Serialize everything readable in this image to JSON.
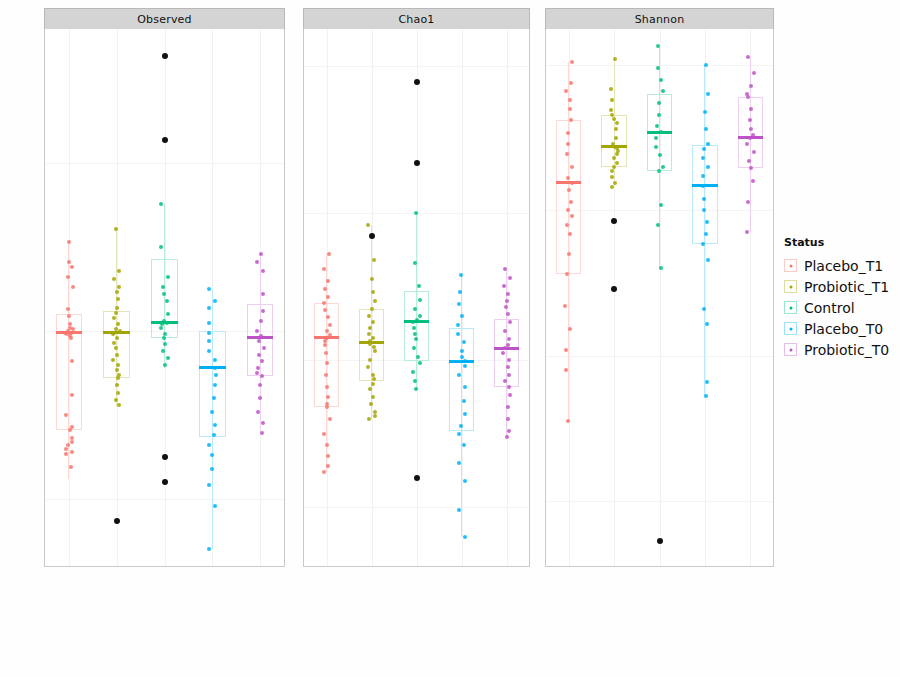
{
  "figure": {
    "ylabel": "Alpha Diversity Measure",
    "legend_title": "Status",
    "panel_order": [
      "Observed",
      "Chao1",
      "Shannon"
    ]
  },
  "legend": {
    "title": "Status",
    "items": [
      {
        "label": "Placebo_T1",
        "color": "#F8766D"
      },
      {
        "label": "Probiotic_T1",
        "color": "#A3A500"
      },
      {
        "label": "Control",
        "color": "#00BF7D"
      },
      {
        "label": "Placebo_T0",
        "color": "#00B0F6"
      },
      {
        "label": "Probiotic_T0",
        "color": "#BD53C6"
      }
    ]
  },
  "categories": [
    "Placebo_T1",
    "Probiotic_T1",
    "Control",
    "Placebo_T0",
    "Probiotic_T0"
  ],
  "chart_data": [
    {
      "type": "box",
      "title": "Observed",
      "xlabel": "",
      "ylabel": "Alpha Diversity Measure",
      "ylim": [
        60,
        380
      ],
      "yticks": [
        100,
        200,
        300
      ],
      "grid": true,
      "legend_position": "right",
      "categories": [
        "Placebo_T1",
        "Probiotic_T1",
        "Control",
        "Placebo_T0",
        "Probiotic_T0"
      ],
      "boxes": [
        {
          "name": "Placebo_T1",
          "color": "#F8766D",
          "q1": 141,
          "median": 199,
          "q3": 210,
          "whisker_low": 112,
          "whisker_high": 253,
          "points": [
            253,
            241,
            238,
            232,
            226,
            213,
            209,
            204,
            202,
            201,
            200,
            199,
            199,
            198,
            197,
            196,
            182,
            162,
            150,
            143,
            141,
            136,
            134,
            132,
            130,
            128,
            127,
            119
          ],
          "outliers": []
        },
        {
          "name": "Probiotic_T1",
          "color": "#A3A500",
          "q1": 172,
          "median": 199,
          "q3": 212,
          "whisker_low": 155,
          "whisker_high": 261,
          "points": [
            261,
            236,
            231,
            226,
            223,
            219,
            214,
            211,
            208,
            204,
            201,
            200,
            199,
            198,
            196,
            193,
            190,
            186,
            183,
            180,
            177,
            174,
            172,
            168,
            163,
            159,
            156
          ],
          "outliers": [
            87
          ]
        },
        {
          "name": "Control",
          "color": "#00BF7D",
          "q1": 196,
          "median": 205,
          "q3": 243,
          "whisker_low": 178,
          "whisker_high": 276,
          "points": [
            276,
            250,
            232,
            226,
            222,
            218,
            210,
            206,
            205,
            204,
            202,
            198,
            196,
            192,
            188,
            184,
            180
          ],
          "outliers": [
            364,
            314,
            125,
            110
          ]
        },
        {
          "name": "Placebo_T0",
          "color": "#00B0F6",
          "q1": 137,
          "median": 178,
          "q3": 200,
          "whisker_low": 70,
          "whisker_high": 225,
          "points": [
            225,
            218,
            214,
            205,
            199,
            194,
            188,
            183,
            178,
            174,
            168,
            160,
            152,
            144,
            138,
            132,
            126,
            118,
            108,
            96,
            70
          ],
          "outliers": []
        },
        {
          "name": "Probiotic_T0",
          "color": "#BD53C6",
          "q1": 173,
          "median": 196,
          "q3": 216,
          "whisker_low": 139,
          "whisker_high": 246,
          "points": [
            246,
            241,
            236,
            222,
            212,
            206,
            200,
            197,
            194,
            190,
            186,
            182,
            178,
            175,
            173,
            168,
            160,
            152,
            145,
            139
          ],
          "outliers": []
        }
      ]
    },
    {
      "type": "box",
      "title": "Chao1",
      "xlabel": "",
      "ylabel": "",
      "ylim": [
        60,
        425
      ],
      "yticks": [
        100,
        200,
        300,
        400
      ],
      "grid": true,
      "legend_position": "right",
      "categories": [
        "Placebo_T1",
        "Probiotic_T1",
        "Control",
        "Placebo_T0",
        "Probiotic_T0"
      ],
      "boxes": [
        {
          "name": "Placebo_T1",
          "color": "#F8766D",
          "q1": 168,
          "median": 215,
          "q3": 239,
          "whisker_low": 124,
          "whisker_high": 272,
          "points": [
            272,
            262,
            254,
            248,
            243,
            239,
            234,
            229,
            224,
            220,
            217,
            215,
            213,
            210,
            205,
            198,
            190,
            182,
            175,
            170,
            168,
            160,
            150,
            142,
            135,
            128,
            124
          ],
          "outliers": []
        },
        {
          "name": "Probiotic_T1",
          "color": "#A3A500",
          "q1": 186,
          "median": 212,
          "q3": 235,
          "whisker_low": 160,
          "whisker_high": 292,
          "points": [
            292,
            268,
            255,
            246,
            240,
            235,
            230,
            226,
            222,
            218,
            215,
            213,
            211,
            209,
            206,
            200,
            195,
            190,
            187,
            184,
            180,
            175,
            170,
            165,
            162,
            160
          ],
          "outliers": [
            284
          ]
        },
        {
          "name": "Control",
          "color": "#00BF7D",
          "q1": 199,
          "median": 226,
          "q3": 247,
          "whisker_low": 180,
          "whisker_high": 300,
          "points": [
            300,
            266,
            250,
            241,
            235,
            230,
            227,
            226,
            222,
            218,
            214,
            208,
            202,
            198,
            192,
            186,
            180
          ],
          "outliers": [
            389,
            334,
            120
          ]
        },
        {
          "name": "Placebo_T0",
          "color": "#00B0F6",
          "q1": 152,
          "median": 199,
          "q3": 222,
          "whisker_low": 80,
          "whisker_high": 258,
          "points": [
            258,
            246,
            238,
            230,
            224,
            218,
            212,
            206,
            202,
            199,
            196,
            190,
            182,
            172,
            163,
            155,
            150,
            142,
            130,
            118,
            98,
            80
          ],
          "outliers": []
        },
        {
          "name": "Probiotic_T0",
          "color": "#BD53C6",
          "q1": 182,
          "median": 208,
          "q3": 228,
          "whisker_low": 148,
          "whisker_high": 262,
          "points": [
            262,
            256,
            250,
            245,
            240,
            236,
            231,
            226,
            220,
            214,
            210,
            208,
            205,
            200,
            195,
            190,
            186,
            182,
            176,
            168,
            160,
            152,
            148
          ],
          "outliers": []
        }
      ]
    },
    {
      "type": "box",
      "title": "Shannon",
      "xlabel": "",
      "ylabel": "",
      "ylim": [
        0.55,
        4.25
      ],
      "yticks": [
        1,
        2,
        3,
        4
      ],
      "grid": true,
      "legend_position": "right",
      "categories": [
        "Placebo_T1",
        "Probiotic_T1",
        "Control",
        "Placebo_T0",
        "Probiotic_T0"
      ],
      "boxes": [
        {
          "name": "Placebo_T1",
          "color": "#F8766D",
          "q1": 2.56,
          "median": 3.19,
          "q3": 3.62,
          "whisker_low": 1.55,
          "whisker_high": 4.02,
          "points": [
            4.02,
            3.88,
            3.82,
            3.76,
            3.7,
            3.62,
            3.53,
            3.46,
            3.39,
            3.3,
            3.22,
            3.19,
            3.14,
            3.06,
            3.0,
            2.96,
            2.9,
            2.84,
            2.7,
            2.56,
            2.34,
            2.18,
            2.04,
            1.9,
            1.55
          ],
          "outliers": []
        },
        {
          "name": "Probiotic_T1",
          "color": "#A3A500",
          "q1": 3.3,
          "median": 3.44,
          "q3": 3.66,
          "whisker_low": 3.16,
          "whisker_high": 4.04,
          "points": [
            4.04,
            3.84,
            3.76,
            3.69,
            3.66,
            3.63,
            3.6,
            3.56,
            3.5,
            3.46,
            3.44,
            3.43,
            3.41,
            3.39,
            3.36,
            3.33,
            3.3,
            3.27,
            3.23,
            3.19,
            3.16
          ],
          "outliers": [
            2.93,
            2.46
          ]
        },
        {
          "name": "Control",
          "color": "#00BF7D",
          "q1": 3.27,
          "median": 3.54,
          "q3": 3.8,
          "whisker_low": 2.6,
          "whisker_high": 4.13,
          "points": [
            4.13,
            3.98,
            3.9,
            3.82,
            3.74,
            3.66,
            3.58,
            3.54,
            3.5,
            3.44,
            3.38,
            3.3,
            3.27,
            3.04,
            2.9,
            2.6
          ],
          "outliers": [
            0.72
          ]
        },
        {
          "name": "Placebo_T0",
          "color": "#00B0F6",
          "q1": 2.77,
          "median": 3.17,
          "q3": 3.45,
          "whisker_low": 1.72,
          "whisker_high": 4.0,
          "points": [
            4.0,
            3.8,
            3.68,
            3.56,
            3.46,
            3.42,
            3.36,
            3.3,
            3.24,
            3.17,
            3.08,
            3.0,
            2.92,
            2.84,
            2.77,
            2.66,
            2.32,
            2.22,
            1.82,
            1.72
          ],
          "outliers": []
        },
        {
          "name": "Probiotic_T0",
          "color": "#BD53C6",
          "q1": 3.29,
          "median": 3.5,
          "q3": 3.78,
          "whisker_low": 2.85,
          "whisker_high": 4.06,
          "points": [
            4.06,
            3.95,
            3.86,
            3.8,
            3.78,
            3.7,
            3.62,
            3.56,
            3.52,
            3.5,
            3.46,
            3.4,
            3.34,
            3.29,
            3.2,
            3.06,
            2.85
          ],
          "outliers": []
        }
      ]
    }
  ]
}
